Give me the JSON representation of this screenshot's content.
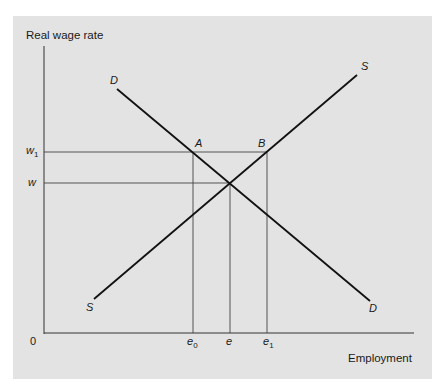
{
  "figure": {
    "y_axis_label": "Real wage rate",
    "x_axis_label": "Employment",
    "origin_label": "0",
    "y_ticks": [
      {
        "base": "w",
        "sub": "1"
      },
      {
        "base": "w",
        "sub": ""
      }
    ],
    "x_ticks": [
      {
        "base": "e",
        "sub": "0"
      },
      {
        "base": "e",
        "sub": ""
      },
      {
        "base": "e",
        "sub": "1"
      }
    ],
    "curve_labels": {
      "demand_top": "D",
      "demand_bottom": "D",
      "supply_top": "S",
      "supply_bottom": "S"
    },
    "point_labels": {
      "a": "A",
      "b": "B"
    },
    "colors": {
      "background": "#e3e3e3",
      "ink": "#1a1a1a"
    }
  }
}
